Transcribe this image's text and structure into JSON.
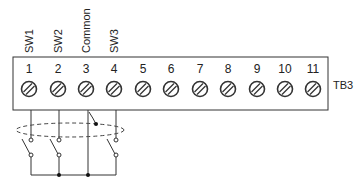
{
  "diagram": {
    "terminal_block": {
      "label": "TB3",
      "terminals": [
        {
          "number": "1",
          "signal": "SW1"
        },
        {
          "number": "2",
          "signal": "SW2"
        },
        {
          "number": "3",
          "signal": "Common"
        },
        {
          "number": "4",
          "signal": "SW3"
        },
        {
          "number": "5",
          "signal": ""
        },
        {
          "number": "6",
          "signal": ""
        },
        {
          "number": "7",
          "signal": ""
        },
        {
          "number": "8",
          "signal": ""
        },
        {
          "number": "9",
          "signal": ""
        },
        {
          "number": "10",
          "signal": ""
        },
        {
          "number": "11",
          "signal": ""
        }
      ]
    },
    "wiring": {
      "switches": [
        "SW1",
        "SW2",
        "SW3"
      ],
      "common_terminal": "3",
      "shield": "dashed-ellipse (shielded cable, drain to terminal 3)"
    }
  }
}
